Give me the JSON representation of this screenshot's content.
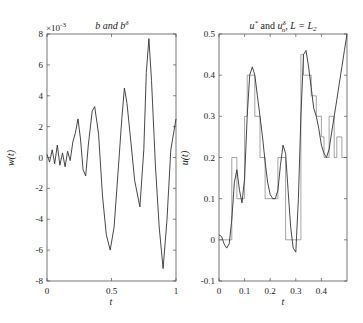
{
  "chart_data": [
    {
      "type": "line",
      "title": "b and b^δ",
      "xlabel": "t",
      "ylabel": "w(t)",
      "y_scale_note": "×10^-3",
      "xlim": [
        0,
        1
      ],
      "ylim": [
        -8,
        8
      ],
      "xticks": [
        "0",
        "0.5",
        "1"
      ],
      "yticks": [
        "-8",
        "-6",
        "-4",
        "-2",
        "0",
        "2",
        "4",
        "6",
        "8"
      ],
      "grid": false,
      "series": [
        {
          "name": "b / b^δ (noisy)",
          "x": [
            0,
            0.02,
            0.04,
            0.06,
            0.08,
            0.1,
            0.12,
            0.14,
            0.16,
            0.18,
            0.2,
            0.22,
            0.24,
            0.26,
            0.28,
            0.3,
            0.32,
            0.35,
            0.37,
            0.4,
            0.43,
            0.46,
            0.49,
            0.52,
            0.55,
            0.58,
            0.6,
            0.62,
            0.65,
            0.68,
            0.72,
            0.75,
            0.77,
            0.79,
            0.81,
            0.84,
            0.87,
            0.9,
            0.93,
            0.96,
            1.0
          ],
          "y": [
            0.2,
            -0.3,
            0.5,
            -0.4,
            0.8,
            -0.5,
            0.3,
            -0.6,
            0.4,
            -0.2,
            1.0,
            1.6,
            2.5,
            1.2,
            -0.8,
            -1.2,
            0.8,
            3.0,
            3.3,
            1.5,
            -2.5,
            -5.0,
            -6.0,
            -4.5,
            -1.0,
            2.5,
            4.5,
            3.5,
            1.0,
            -1.5,
            -3.2,
            0.5,
            5.5,
            7.7,
            5.0,
            -0.5,
            -4.5,
            -7.2,
            -4.0,
            0.5,
            2.5
          ]
        }
      ]
    },
    {
      "type": "line",
      "title": "u* and u_n^δ, L = L_2",
      "xlabel": "t",
      "ylabel": "u(t)",
      "xlim": [
        0,
        0.5
      ],
      "ylim": [
        -0.1,
        0.5
      ],
      "xticks": [
        "0",
        "0.1",
        "0.2",
        "0.3",
        "0.4"
      ],
      "yticks": [
        "-0.1",
        "0",
        "0.1",
        "0.2",
        "0.3",
        "0.4",
        "0.5"
      ],
      "grid": false,
      "series": [
        {
          "name": "u* (smooth)",
          "x": [
            0,
            0.01,
            0.02,
            0.03,
            0.04,
            0.05,
            0.06,
            0.07,
            0.08,
            0.09,
            0.1,
            0.11,
            0.12,
            0.13,
            0.14,
            0.15,
            0.16,
            0.17,
            0.18,
            0.19,
            0.2,
            0.21,
            0.22,
            0.23,
            0.24,
            0.25,
            0.26,
            0.27,
            0.28,
            0.29,
            0.3,
            0.31,
            0.32,
            0.33,
            0.34,
            0.35,
            0.36,
            0.37,
            0.38,
            0.39,
            0.4,
            0.41,
            0.42,
            0.43,
            0.44,
            0.45,
            0.46,
            0.47,
            0.48,
            0.49,
            0.5
          ],
          "y": [
            0.012,
            0.008,
            -0.01,
            -0.02,
            -0.01,
            0.05,
            0.14,
            0.17,
            0.12,
            0.09,
            0.15,
            0.3,
            0.4,
            0.42,
            0.4,
            0.35,
            0.3,
            0.25,
            0.19,
            0.14,
            0.11,
            0.1,
            0.1,
            0.12,
            0.18,
            0.23,
            0.21,
            0.12,
            0.03,
            -0.02,
            -0.03,
            0.1,
            0.3,
            0.45,
            0.46,
            0.42,
            0.37,
            0.32,
            0.3,
            0.27,
            0.23,
            0.21,
            0.2,
            0.22,
            0.26,
            0.3,
            0.34,
            0.38,
            0.42,
            0.46,
            0.5
          ]
        },
        {
          "name": "u_n^δ (piecewise constant)",
          "steps": [
            {
              "x0": 0.0,
              "x1": 0.05,
              "y": 0.0
            },
            {
              "x0": 0.05,
              "x1": 0.07,
              "y": 0.2
            },
            {
              "x0": 0.07,
              "x1": 0.1,
              "y": 0.1
            },
            {
              "x0": 0.1,
              "x1": 0.11,
              "y": 0.3
            },
            {
              "x0": 0.11,
              "x1": 0.14,
              "y": 0.4
            },
            {
              "x0": 0.14,
              "x1": 0.16,
              "y": 0.3
            },
            {
              "x0": 0.16,
              "x1": 0.18,
              "y": 0.2
            },
            {
              "x0": 0.18,
              "x1": 0.23,
              "y": 0.1
            },
            {
              "x0": 0.23,
              "x1": 0.26,
              "y": 0.2
            },
            {
              "x0": 0.26,
              "x1": 0.3,
              "y": 0.0
            },
            {
              "x0": 0.3,
              "x1": 0.32,
              "y": 0.0
            },
            {
              "x0": 0.32,
              "x1": 0.33,
              "y": 0.45
            },
            {
              "x0": 0.33,
              "x1": 0.36,
              "y": 0.4
            },
            {
              "x0": 0.36,
              "x1": 0.38,
              "y": 0.35
            },
            {
              "x0": 0.38,
              "x1": 0.4,
              "y": 0.3
            },
            {
              "x0": 0.4,
              "x1": 0.41,
              "y": 0.25
            },
            {
              "x0": 0.41,
              "x1": 0.43,
              "y": 0.2
            },
            {
              "x0": 0.43,
              "x1": 0.45,
              "y": 0.3
            },
            {
              "x0": 0.45,
              "x1": 0.46,
              "y": 0.2
            },
            {
              "x0": 0.46,
              "x1": 0.48,
              "y": 0.25
            },
            {
              "x0": 0.48,
              "x1": 0.5,
              "y": 0.2
            }
          ]
        }
      ]
    }
  ],
  "left": {
    "title_main": "b and b",
    "title_sup": "δ",
    "scale_main": "×10",
    "scale_sup": "-3",
    "ylabel": "w(t)",
    "xlabel": "t",
    "yticks": [
      "8",
      "6",
      "4",
      "2",
      "0",
      "-2",
      "-4",
      "-6",
      "-8"
    ],
    "xticks": [
      "0",
      "0.5",
      "1"
    ]
  },
  "right": {
    "title_u": "u",
    "title_star": "*",
    "title_and": " and ",
    "title_u2": "u",
    "title_sub": "n",
    "title_sup": "δ",
    "title_rest": ", L = L",
    "title_sub2": "2",
    "ylabel": "u(t)",
    "xlabel": "t",
    "yticks": [
      "0.5",
      "0.4",
      "0.3",
      "0.2",
      "0.1",
      "0",
      "-0.1"
    ],
    "xticks": [
      "0",
      "0.1",
      "0.2",
      "0.3",
      "0.4"
    ]
  }
}
